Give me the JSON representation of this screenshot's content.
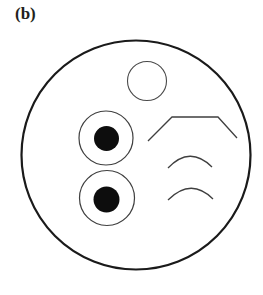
{
  "figure": {
    "panel_label": "(b)",
    "caption_text": "(b)",
    "background_color": "#ffffff",
    "width": 263,
    "height": 295,
    "stroke_color_heavy": "#1a1a1a",
    "stroke_color_light": "#4d4d4d",
    "fill_color_dark": "#0d0d0d"
  },
  "shapes": {
    "outer_boundary": {
      "name": "outer-circle",
      "cx": 136,
      "cy": 155,
      "r": 114.5,
      "stroke_width": 2.2,
      "fill": "none"
    },
    "top_circle": {
      "name": "top-open-circle",
      "cx": 147,
      "cy": 81,
      "r": 19.5,
      "stroke_width": 1.1,
      "fill": "none"
    },
    "eye_upper_ring": {
      "name": "upper-ring",
      "cx": 106,
      "cy": 138,
      "r": 27,
      "stroke_width": 1.1,
      "fill": "none"
    },
    "eye_upper_dot": {
      "name": "upper-filled-dot",
      "cx": 106.5,
      "cy": 138.5,
      "r": 12.5,
      "fill": "#0d0d0d"
    },
    "eye_lower_ring": {
      "name": "lower-ring",
      "cx": 107,
      "cy": 198,
      "r": 27.5,
      "stroke_width": 1.1,
      "fill": "none"
    },
    "eye_lower_dot": {
      "name": "lower-filled-dot",
      "cx": 106.5,
      "cy": 199.5,
      "r": 13,
      "fill": "#0d0d0d"
    },
    "chevron": {
      "name": "chevron-polyline",
      "points": "148,141 172,117 218,117 237,138",
      "stroke_width": 1.3,
      "fill": "none"
    },
    "arc_upper": {
      "name": "upper-arc",
      "path": "M 168 168 Q 190 145 212 167",
      "stroke_width": 1.3,
      "fill": "none"
    },
    "arc_lower": {
      "name": "lower-arc",
      "path": "M 168 200 Q 191 177 213 199",
      "stroke_width": 1.3,
      "fill": "none"
    }
  }
}
